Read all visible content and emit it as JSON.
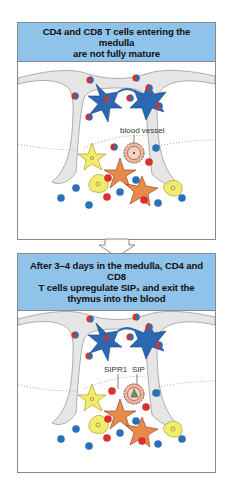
{
  "panels": [
    {
      "header_lines": [
        "CD4 and CD8 T cells entering the medulla",
        "are not fully mature"
      ],
      "labels": {
        "vessel": "blood vessel"
      }
    },
    {
      "header_lines": [
        "After 3–4 days in the medulla, CD4 and CD8",
        "T cells upregulate SIP₁ and exit the",
        "thymus into the blood"
      ],
      "labels": {
        "receptor": "SIPR1",
        "ligand": "SIP"
      }
    }
  ],
  "colors": {
    "header_bg": "#8fc3ea",
    "capsule": "#e6e6e6",
    "dendritic_cell": "#2a68b4",
    "t_cell_red": "#d8302a",
    "t_cell_blue": "#2a6fb8",
    "macrophage": "#f3ec6a",
    "epithelial": "#e88a4a",
    "vessel": "#e8b8a0"
  }
}
